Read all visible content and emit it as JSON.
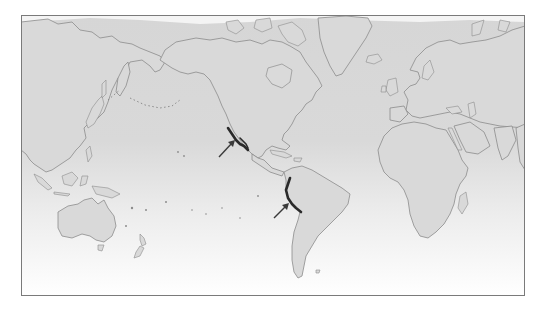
{
  "map": {
    "projection": "Mercator (Pacific-centered)",
    "style": "grayscale",
    "colors": {
      "ocean_top": "#dcdcdc",
      "ocean_bottom": "#ffffff",
      "land_fill": "#d9d9d9",
      "land_outline": "#8c8c8c",
      "frame_border": "#7a7a7a",
      "highlight_coast": "#2a2a2a",
      "arrow": "#3a3a3a"
    },
    "frame": {
      "x": 21,
      "y": 15,
      "width": 504,
      "height": 281
    },
    "regions_shown": [
      "Asia",
      "Australia",
      "New Zealand",
      "North America",
      "Central America",
      "South America",
      "Greenland",
      "Europe",
      "Africa",
      "Madagascar"
    ],
    "markers": [
      {
        "id": "arrow-1",
        "icon": "arrow-icon",
        "points_to": "western North America coast (California / Baja)",
        "from": [
          219,
          157
        ],
        "to": [
          234,
          141
        ]
      },
      {
        "id": "arrow-2",
        "icon": "arrow-icon",
        "points_to": "western South America coast (Peru / northern Chile)",
        "from": [
          274,
          218
        ],
        "to": [
          288,
          204
        ]
      }
    ],
    "highlighted_coastlines": [
      {
        "id": "coast-north-america",
        "description": "dark line along Pacific coast of North America"
      },
      {
        "id": "coast-south-america",
        "description": "dark line along Pacific coast of South America"
      }
    ]
  }
}
